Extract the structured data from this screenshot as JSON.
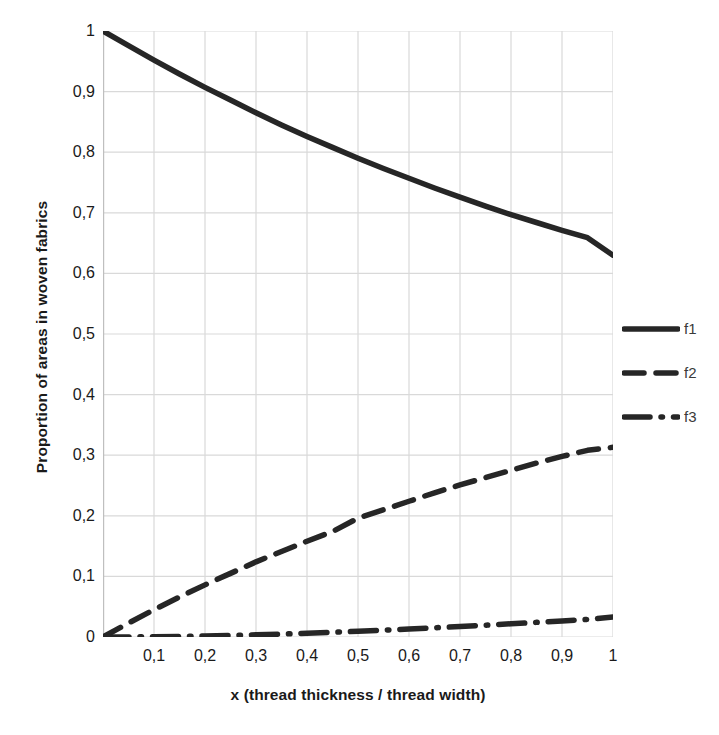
{
  "chart_data": {
    "type": "line",
    "title": "",
    "xlabel": "x (thread thickness / thread width)",
    "ylabel": "Proportion of areas in woven fabrics",
    "xlim": [
      0,
      1
    ],
    "ylim": [
      0,
      1
    ],
    "grid": true,
    "legend_position": "right",
    "decimal_separator": ",",
    "xtick_labels": [
      "0,1",
      "0,2",
      "0,3",
      "0,4",
      "0,5",
      "0,6",
      "0,7",
      "0,8",
      "0,9",
      "1"
    ],
    "xtick_values": [
      0.1,
      0.2,
      0.3,
      0.4,
      0.5,
      0.6,
      0.7,
      0.8,
      0.9,
      1.0
    ],
    "ytick_labels": [
      "0",
      "0,1",
      "0,2",
      "0,3",
      "0,4",
      "0,5",
      "0,6",
      "0,7",
      "0,8",
      "0,9",
      "1"
    ],
    "ytick_values": [
      0,
      0.1,
      0.2,
      0.3,
      0.4,
      0.5,
      0.6,
      0.7,
      0.8,
      0.9,
      1.0
    ],
    "x": [
      0,
      0.05,
      0.1,
      0.15,
      0.2,
      0.25,
      0.3,
      0.35,
      0.4,
      0.45,
      0.5,
      0.55,
      0.6,
      0.65,
      0.7,
      0.75,
      0.8,
      0.85,
      0.9,
      0.95,
      1.0
    ],
    "series": [
      {
        "name": "f1",
        "style": "solid",
        "color": "#262626",
        "values": [
          1.0,
          0.976,
          0.952,
          0.929,
          0.907,
          0.886,
          0.865,
          0.845,
          0.826,
          0.808,
          0.79,
          0.773,
          0.757,
          0.741,
          0.726,
          0.711,
          0.697,
          0.684,
          0.671,
          0.659,
          0.63
        ]
      },
      {
        "name": "f2",
        "style": "dashed",
        "color": "#262626",
        "values": [
          0.0,
          0.023,
          0.045,
          0.066,
          0.086,
          0.105,
          0.124,
          0.141,
          0.158,
          0.174,
          0.196,
          0.21,
          0.224,
          0.238,
          0.251,
          0.263,
          0.275,
          0.287,
          0.298,
          0.308,
          0.313
        ]
      },
      {
        "name": "f3",
        "style": "dashdot",
        "color": "#262626",
        "values": [
          0.0,
          0.0001,
          0.0004,
          0.0009,
          0.0016,
          0.0025,
          0.0036,
          0.0048,
          0.0062,
          0.0078,
          0.0095,
          0.0113,
          0.0132,
          0.0152,
          0.0173,
          0.0195,
          0.0218,
          0.0242,
          0.0266,
          0.0291,
          0.033
        ]
      }
    ],
    "legend_entries": [
      {
        "label": "f1",
        "style": "solid"
      },
      {
        "label": "f2",
        "style": "dashed"
      },
      {
        "label": "f3",
        "style": "dashdot"
      }
    ],
    "colors": {
      "line": "#262626",
      "grid": "#d9d9d9",
      "axis": "#bfbfbf",
      "text": "#1a1a1a",
      "legend_text": "#3a3a3a",
      "background": "#ffffff"
    }
  }
}
